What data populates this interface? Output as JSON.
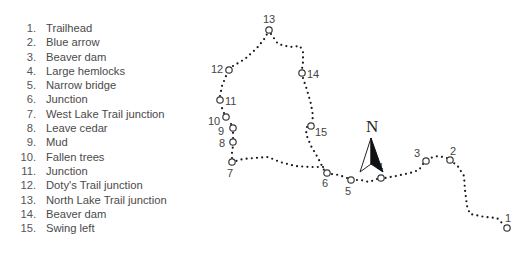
{
  "legend": {
    "items": [
      {
        "num": "1.",
        "label": "Trailhead"
      },
      {
        "num": "2.",
        "label": "Blue arrow"
      },
      {
        "num": "3.",
        "label": "Beaver dam"
      },
      {
        "num": "4.",
        "label": "Large hemlocks"
      },
      {
        "num": "5.",
        "label": "Narrow bridge"
      },
      {
        "num": "6.",
        "label": "Junction"
      },
      {
        "num": "7.",
        "label": "West Lake Trail junction"
      },
      {
        "num": "8.",
        "label": "Leave cedar"
      },
      {
        "num": "9.",
        "label": "Mud"
      },
      {
        "num": "10.",
        "label": "Fallen trees"
      },
      {
        "num": "11.",
        "label": "Junction"
      },
      {
        "num": "12.",
        "label": "Doty's Trail junction"
      },
      {
        "num": "13.",
        "label": "North Lake Trail junction"
      },
      {
        "num": "14.",
        "label": "Beaver dam"
      },
      {
        "num": "15.",
        "label": "Swing left"
      }
    ]
  },
  "map": {
    "north_label": "N",
    "trail_color": "#1a1a1a",
    "waypoints": [
      {
        "id": "1",
        "label": "1"
      },
      {
        "id": "2",
        "label": "2"
      },
      {
        "id": "3",
        "label": "3"
      },
      {
        "id": "4",
        "label": "4"
      },
      {
        "id": "5",
        "label": "5"
      },
      {
        "id": "6",
        "label": "6"
      },
      {
        "id": "7",
        "label": "7"
      },
      {
        "id": "8",
        "label": "8"
      },
      {
        "id": "9",
        "label": "9"
      },
      {
        "id": "10",
        "label": "10"
      },
      {
        "id": "11",
        "label": "11"
      },
      {
        "id": "12",
        "label": "12"
      },
      {
        "id": "13",
        "label": "13"
      },
      {
        "id": "14",
        "label": "14"
      },
      {
        "id": "15",
        "label": "15"
      }
    ]
  }
}
